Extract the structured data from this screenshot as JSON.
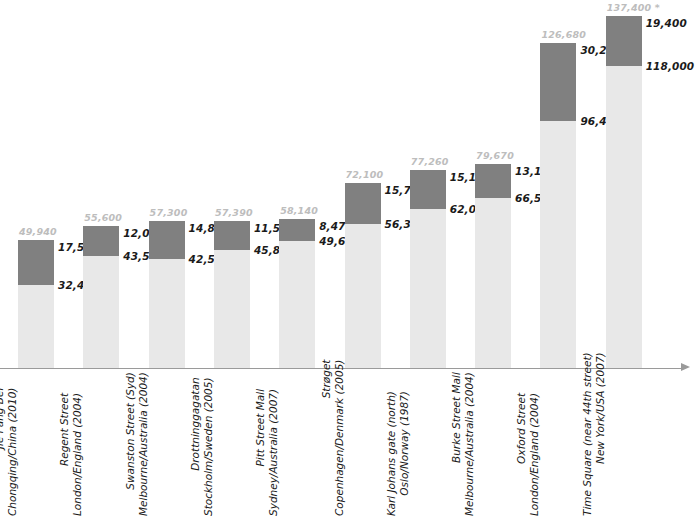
{
  "chart_data": {
    "type": "bar",
    "title": "",
    "subtitle": "",
    "xlabel": "",
    "ylabel": "",
    "stacked": true,
    "grid": false,
    "legend_position": "none",
    "ylim": [
      0,
      137400
    ],
    "axis": {
      "has_x_axis_line": true,
      "x_axis_arrow": true,
      "has_y_axis": false,
      "tick_labels": []
    },
    "footnote_marker": "*",
    "categories": [
      "Jie Fang Bei\nChongqing/China (2010)",
      "Regent Street\nLondon/England (2004)",
      "Swanston Street (Syd)\nMelbourne/Australia (2004)",
      "Drottninggagatan\nStockholm/Sweden (2005)",
      "Pitt Street Mall\nSydney/Australia (2007)",
      "Strøget\nCopenhagen/Denmark (2005)",
      "Karl Johans gate (north)\nOslo/Norway (1987)",
      "Burke Street Mall\nMelbourne/Australia (2004)",
      "Oxford Street\nLondon/England (2004)",
      "Time Square (near 44th street)\nNew York/USA (2007)"
    ],
    "series": [
      {
        "name": "lower-segment",
        "color": "#e8e8e8",
        "values": [
          32400,
          43550,
          42500,
          45880,
          49670,
          56390,
          62080,
          66550,
          96430,
          118000
        ]
      },
      {
        "name": "upper-segment",
        "color": "#808080",
        "values": [
          17540,
          12050,
          14800,
          11510,
          8470,
          15710,
          15180,
          13120,
          30250,
          19400
        ]
      }
    ],
    "totals": [
      49940,
      55600,
      57300,
      57390,
      58140,
      72100,
      77260,
      79670,
      126680,
      137400
    ],
    "points": [
      {
        "name_line1": "Jie Fang Bei",
        "name_line2": "Chongqing/China (2010)",
        "total_label": "49,940",
        "upper_label": "17,540",
        "lower_label": "32,400",
        "total": 49940,
        "upper": 17540,
        "lower": 32400
      },
      {
        "name_line1": "Regent Street",
        "name_line2": "London/England (2004)",
        "total_label": "55,600",
        "upper_label": "12,050",
        "lower_label": "43,550",
        "total": 55600,
        "upper": 12050,
        "lower": 43550
      },
      {
        "name_line1": "Swanston Street (Syd)",
        "name_line2": "Melbourne/Australia (2004)",
        "total_label": "57,300",
        "upper_label": "14,800",
        "lower_label": "42,500",
        "total": 57300,
        "upper": 14800,
        "lower": 42500
      },
      {
        "name_line1": "Drottninggagatan",
        "name_line2": "Stockholm/Sweden (2005)",
        "total_label": "57,390",
        "upper_label": "11,510",
        "lower_label": "45,880",
        "total": 57390,
        "upper": 11510,
        "lower": 45880
      },
      {
        "name_line1": "Pitt Street Mall",
        "name_line2": "Sydney/Australia (2007)",
        "total_label": "58,140",
        "upper_label": "8,470",
        "lower_label": "49,670",
        "total": 58140,
        "upper": 8470,
        "lower": 49670
      },
      {
        "name_line1": "Strøget",
        "name_line2": "Copenhagen/Denmark (2005)",
        "total_label": "72,100",
        "upper_label": "15,710",
        "lower_label": "56,390",
        "total": 72100,
        "upper": 15710,
        "lower": 56390
      },
      {
        "name_line1": "Karl Johans gate (north)",
        "name_line2": "Oslo/Norway (1987)",
        "total_label": "77,260",
        "upper_label": "15,180",
        "lower_label": "62,080",
        "total": 77260,
        "upper": 15180,
        "lower": 62080
      },
      {
        "name_line1": "Burke Street Mall",
        "name_line2": "Melbourne/Australia (2004)",
        "total_label": "79,670",
        "upper_label": "13,120",
        "lower_label": "66,550",
        "total": 79670,
        "upper": 13120,
        "lower": 66550
      },
      {
        "name_line1": "Oxford Street",
        "name_line2": "London/England (2004)",
        "total_label": "126,680",
        "upper_label": "30,250",
        "lower_label": "96,430",
        "total": 126680,
        "upper": 30250,
        "lower": 96430
      },
      {
        "name_line1": "Time Square (near 44th street)",
        "name_line2": "New York/USA (2007)",
        "total_label": "137,400 *",
        "upper_label": "19,400",
        "lower_label": "118,000",
        "total": 137400,
        "upper": 19400,
        "lower": 118000
      }
    ],
    "colors": {
      "lower_segment": "#e8e8e8",
      "upper_segment": "#808080",
      "total_label": "#bdbdbd",
      "segment_label": "#1a1a1a",
      "axis": "#9a9a9a",
      "background": "#ffffff"
    }
  }
}
